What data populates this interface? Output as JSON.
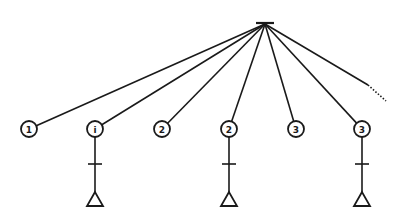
{
  "diagram": {
    "type": "tree",
    "root": {
      "shape": "horizontal-bar",
      "x": 265,
      "y": 23,
      "half_width": 9
    },
    "nodes": [
      {
        "id": "n1",
        "label": "1",
        "x": 29,
        "y": 129,
        "has_subtree": false
      },
      {
        "id": "n2",
        "label": "i",
        "x": 95,
        "y": 129,
        "has_subtree": true
      },
      {
        "id": "n3",
        "label": "2",
        "x": 162,
        "y": 129,
        "has_subtree": false
      },
      {
        "id": "n4",
        "label": "2",
        "x": 229,
        "y": 129,
        "has_subtree": true
      },
      {
        "id": "n5",
        "label": "3",
        "x": 296,
        "y": 129,
        "has_subtree": false
      },
      {
        "id": "n6",
        "label": "3",
        "x": 362,
        "y": 129,
        "has_subtree": true
      }
    ],
    "continuation": {
      "solid_end": [
        368,
        85
      ],
      "dotted_end": [
        386,
        101
      ],
      "meaning": "more children omitted"
    },
    "subtree_marker": {
      "tick_y_offset": 35,
      "tick_half_width": 7,
      "triangle_apex_offset": 63,
      "triangle_base_offset": 77,
      "triangle_half_width": 8
    },
    "node_radius": 8,
    "stroke_color": "#1a1a1a"
  }
}
